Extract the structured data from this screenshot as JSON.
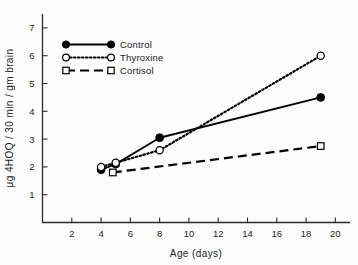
{
  "chart_data": {
    "type": "line",
    "title": "",
    "xlabel": "Age (days)",
    "ylabel": "μg 4HOQ / 30 min / gm brain",
    "xlim": [
      0,
      21
    ],
    "ylim": [
      0,
      7.5
    ],
    "xticks": [
      2,
      4,
      6,
      8,
      10,
      12,
      14,
      16,
      18,
      20
    ],
    "yticks": [
      1,
      2,
      3,
      4,
      5,
      6,
      7
    ],
    "xtick_labels": [
      "2",
      "4",
      "6",
      "8",
      "10",
      "12",
      "14",
      "16",
      "18",
      "20"
    ],
    "ytick_labels": [
      "1",
      "2",
      "3",
      "4",
      "5",
      "6",
      "7"
    ],
    "grid": false,
    "legend_position": "upper-left",
    "series": [
      {
        "name": "Control",
        "marker": "filled-circle",
        "linestyle": "solid",
        "color": "#000000",
        "x": [
          4,
          5,
          8,
          19
        ],
        "y": [
          1.9,
          2.1,
          3.05,
          4.5
        ]
      },
      {
        "name": "Thyroxine",
        "marker": "open-circle",
        "linestyle": "dotted",
        "color": "#000000",
        "x": [
          4,
          5,
          8,
          19
        ],
        "y": [
          2.0,
          2.15,
          2.6,
          6.0
        ]
      },
      {
        "name": "Cortisol",
        "marker": "open-square",
        "linestyle": "dashed",
        "color": "#000000",
        "x": [
          4.8,
          19
        ],
        "y": [
          1.8,
          2.75
        ]
      }
    ]
  },
  "legend": {
    "entries": [
      {
        "label": "Control"
      },
      {
        "label": "Thyroxine"
      },
      {
        "label": "Cortisol"
      }
    ]
  },
  "axes": {
    "x_title": "Age (days)",
    "y_title": "μg 4HOQ / 30 min / gm brain"
  }
}
